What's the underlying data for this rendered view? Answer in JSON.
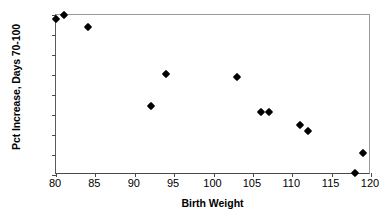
{
  "chart_data": {
    "type": "scatter",
    "title": "",
    "xlabel": "Birth Weight",
    "ylabel": "Pct Increase, Days 70-100",
    "xlim": [
      80,
      120
    ],
    "ylim": [
      40,
      120
    ],
    "xticks": [
      80,
      85,
      90,
      95,
      100,
      105,
      110,
      115,
      120
    ],
    "yticks": [
      40,
      50,
      60,
      70,
      80,
      90,
      100,
      110,
      120
    ],
    "grid": false,
    "legend": null,
    "marker": "filled-diamond",
    "marker_color": "#000000",
    "points": [
      {
        "x": 80,
        "y": 118
      },
      {
        "x": 81,
        "y": 120
      },
      {
        "x": 84,
        "y": 114
      },
      {
        "x": 92,
        "y": 74.5
      },
      {
        "x": 94,
        "y": 90.5
      },
      {
        "x": 103,
        "y": 89
      },
      {
        "x": 106,
        "y": 71.5
      },
      {
        "x": 107,
        "y": 71.5
      },
      {
        "x": 111,
        "y": 65
      },
      {
        "x": 112,
        "y": 62
      },
      {
        "x": 118,
        "y": 41
      },
      {
        "x": 119,
        "y": 51
      }
    ]
  }
}
